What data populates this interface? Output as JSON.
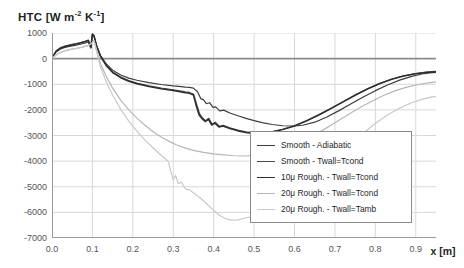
{
  "chart_data": {
    "type": "line",
    "title": "HTC [W m-2 K-1]",
    "title_parts": {
      "main": "HTC [W m",
      "sup1": "-2",
      "mid": " K",
      "sup2": "-1",
      "tail": "]"
    },
    "xlabel": "x [m]",
    "ylabel": "HTC [W m-2 K-1]",
    "xlim": [
      0.0,
      0.95
    ],
    "ylim": [
      -7000,
      1000
    ],
    "xticks": [
      "0.0",
      "0.1",
      "0.2",
      "0.3",
      "0.4",
      "0.5",
      "0.6",
      "0.7",
      "0.8",
      "0.9"
    ],
    "xtick_values": [
      0.0,
      0.1,
      0.2,
      0.3,
      0.4,
      0.5,
      0.6,
      0.7,
      0.8,
      0.9
    ],
    "yticks": [
      "1000",
      "0",
      "-1000",
      "-2000",
      "-3000",
      "-4000",
      "-5000",
      "-6000",
      "-7000"
    ],
    "ytick_values": [
      1000,
      0,
      -1000,
      -2000,
      -3000,
      -4000,
      -5000,
      -6000,
      -7000
    ],
    "grid": true,
    "legend_position": "lower right",
    "series": [
      {
        "name": "Smooth - Adiabatic",
        "color": "#3d3d3d",
        "width": 1.2,
        "points": [
          [
            0.0,
            30
          ],
          [
            0.01,
            260
          ],
          [
            0.02,
            370
          ],
          [
            0.03,
            430
          ],
          [
            0.04,
            470
          ],
          [
            0.05,
            500
          ],
          [
            0.06,
            530
          ],
          [
            0.07,
            560
          ],
          [
            0.08,
            600
          ],
          [
            0.09,
            650
          ],
          [
            0.096,
            420
          ],
          [
            0.1,
            930
          ],
          [
            0.104,
            880
          ],
          [
            0.11,
            500
          ],
          [
            0.12,
            120
          ],
          [
            0.135,
            -220
          ],
          [
            0.15,
            -450
          ],
          [
            0.17,
            -640
          ],
          [
            0.19,
            -760
          ],
          [
            0.21,
            -845
          ],
          [
            0.24,
            -940
          ],
          [
            0.27,
            -1010
          ],
          [
            0.3,
            -1065
          ],
          [
            0.32,
            -1095
          ],
          [
            0.33,
            -1110
          ],
          [
            0.34,
            -1120
          ],
          [
            0.35,
            -1150
          ],
          [
            0.36,
            -1290
          ],
          [
            0.368,
            -1560
          ],
          [
            0.375,
            -1610
          ],
          [
            0.382,
            -1760
          ],
          [
            0.39,
            -1720
          ],
          [
            0.398,
            -1900
          ],
          [
            0.405,
            -1880
          ],
          [
            0.415,
            -2040
          ],
          [
            0.425,
            -2010
          ],
          [
            0.44,
            -2120
          ],
          [
            0.46,
            -2230
          ],
          [
            0.48,
            -2330
          ],
          [
            0.5,
            -2420
          ],
          [
            0.52,
            -2500
          ],
          [
            0.545,
            -2570
          ],
          [
            0.57,
            -2620
          ],
          [
            0.6,
            -2630
          ],
          [
            0.62,
            -2600
          ],
          [
            0.65,
            -2480
          ],
          [
            0.68,
            -2280
          ],
          [
            0.71,
            -2030
          ],
          [
            0.74,
            -1760
          ],
          [
            0.77,
            -1500
          ],
          [
            0.8,
            -1250
          ],
          [
            0.83,
            -1030
          ],
          [
            0.86,
            -840
          ],
          [
            0.89,
            -690
          ],
          [
            0.915,
            -600
          ],
          [
            0.935,
            -560
          ],
          [
            0.95,
            -540
          ]
        ]
      },
      {
        "name": "Smooth - Twall=Tcond",
        "color": "#4a4a4a",
        "width": 1.2,
        "points": [
          [
            0.0,
            25
          ],
          [
            0.01,
            300
          ],
          [
            0.02,
            420
          ],
          [
            0.03,
            480
          ],
          [
            0.04,
            520
          ],
          [
            0.05,
            555
          ],
          [
            0.06,
            585
          ],
          [
            0.07,
            620
          ],
          [
            0.08,
            665
          ],
          [
            0.09,
            720
          ],
          [
            0.096,
            450
          ],
          [
            0.1,
            960
          ],
          [
            0.104,
            900
          ],
          [
            0.11,
            520
          ],
          [
            0.12,
            100
          ],
          [
            0.135,
            -270
          ],
          [
            0.15,
            -520
          ],
          [
            0.17,
            -720
          ],
          [
            0.19,
            -860
          ],
          [
            0.21,
            -955
          ],
          [
            0.24,
            -1060
          ],
          [
            0.27,
            -1145
          ],
          [
            0.3,
            -1215
          ],
          [
            0.32,
            -1265
          ],
          [
            0.33,
            -1295
          ],
          [
            0.34,
            -1320
          ],
          [
            0.35,
            -1380
          ],
          [
            0.358,
            -1790
          ],
          [
            0.365,
            -2150
          ],
          [
            0.372,
            -2300
          ],
          [
            0.38,
            -2420
          ],
          [
            0.388,
            -2330
          ],
          [
            0.396,
            -2560
          ],
          [
            0.404,
            -2480
          ],
          [
            0.414,
            -2640
          ],
          [
            0.424,
            -2600
          ],
          [
            0.44,
            -2700
          ],
          [
            0.46,
            -2790
          ],
          [
            0.48,
            -2860
          ],
          [
            0.5,
            -2900
          ],
          [
            0.52,
            -2900
          ],
          [
            0.545,
            -2850
          ],
          [
            0.57,
            -2760
          ],
          [
            0.6,
            -2620
          ],
          [
            0.63,
            -2420
          ],
          [
            0.66,
            -2190
          ],
          [
            0.69,
            -1940
          ],
          [
            0.72,
            -1680
          ],
          [
            0.75,
            -1420
          ],
          [
            0.78,
            -1180
          ],
          [
            0.81,
            -970
          ],
          [
            0.84,
            -800
          ],
          [
            0.87,
            -670
          ],
          [
            0.9,
            -580
          ],
          [
            0.925,
            -530
          ],
          [
            0.95,
            -500
          ]
        ]
      },
      {
        "name": "10u Rough. - Twall=Tcond",
        "color": "#2e2e2e",
        "width": 1.5,
        "points": [
          [
            0.0,
            20
          ],
          [
            0.01,
            280
          ],
          [
            0.02,
            400
          ],
          [
            0.03,
            460
          ],
          [
            0.04,
            505
          ],
          [
            0.05,
            540
          ],
          [
            0.06,
            575
          ],
          [
            0.07,
            610
          ],
          [
            0.08,
            655
          ],
          [
            0.09,
            710
          ],
          [
            0.096,
            430
          ],
          [
            0.1,
            950
          ],
          [
            0.104,
            890
          ],
          [
            0.11,
            510
          ],
          [
            0.12,
            90
          ],
          [
            0.135,
            -290
          ],
          [
            0.15,
            -545
          ],
          [
            0.17,
            -745
          ],
          [
            0.19,
            -885
          ],
          [
            0.21,
            -980
          ],
          [
            0.24,
            -1090
          ],
          [
            0.27,
            -1175
          ],
          [
            0.3,
            -1245
          ],
          [
            0.32,
            -1300
          ],
          [
            0.33,
            -1330
          ],
          [
            0.34,
            -1355
          ],
          [
            0.35,
            -1420
          ],
          [
            0.357,
            -1850
          ],
          [
            0.364,
            -2200
          ],
          [
            0.371,
            -2340
          ],
          [
            0.379,
            -2455
          ],
          [
            0.387,
            -2370
          ],
          [
            0.395,
            -2590
          ],
          [
            0.403,
            -2520
          ],
          [
            0.413,
            -2670
          ],
          [
            0.423,
            -2630
          ],
          [
            0.44,
            -2730
          ],
          [
            0.46,
            -2820
          ],
          [
            0.48,
            -2880
          ],
          [
            0.5,
            -2920
          ],
          [
            0.52,
            -2915
          ],
          [
            0.545,
            -2860
          ],
          [
            0.57,
            -2770
          ],
          [
            0.6,
            -2630
          ],
          [
            0.63,
            -2430
          ],
          [
            0.66,
            -2200
          ],
          [
            0.69,
            -1950
          ],
          [
            0.72,
            -1690
          ],
          [
            0.75,
            -1430
          ],
          [
            0.78,
            -1190
          ],
          [
            0.81,
            -980
          ],
          [
            0.84,
            -810
          ],
          [
            0.87,
            -680
          ],
          [
            0.9,
            -590
          ],
          [
            0.925,
            -540
          ],
          [
            0.95,
            -510
          ]
        ]
      },
      {
        "name": "20u Rough. - Twall=Tcond",
        "color": "#b6b6b6",
        "width": 1.2,
        "points": [
          [
            0.0,
            15
          ],
          [
            0.015,
            200
          ],
          [
            0.03,
            300
          ],
          [
            0.045,
            360
          ],
          [
            0.06,
            400
          ],
          [
            0.075,
            450
          ],
          [
            0.09,
            520
          ],
          [
            0.098,
            600
          ],
          [
            0.104,
            700
          ],
          [
            0.112,
            250
          ],
          [
            0.12,
            -200
          ],
          [
            0.135,
            -720
          ],
          [
            0.15,
            -1150
          ],
          [
            0.17,
            -1620
          ],
          [
            0.19,
            -2000
          ],
          [
            0.21,
            -2320
          ],
          [
            0.23,
            -2600
          ],
          [
            0.25,
            -2850
          ],
          [
            0.27,
            -3060
          ],
          [
            0.29,
            -3230
          ],
          [
            0.31,
            -3380
          ],
          [
            0.33,
            -3490
          ],
          [
            0.35,
            -3580
          ],
          [
            0.375,
            -3660
          ],
          [
            0.4,
            -3720
          ],
          [
            0.425,
            -3760
          ],
          [
            0.45,
            -3790
          ],
          [
            0.475,
            -3800
          ],
          [
            0.5,
            -3780
          ],
          [
            0.525,
            -3730
          ],
          [
            0.55,
            -3650
          ],
          [
            0.58,
            -3500
          ],
          [
            0.61,
            -3300
          ],
          [
            0.64,
            -3060
          ],
          [
            0.67,
            -2790
          ],
          [
            0.7,
            -2500
          ],
          [
            0.73,
            -2210
          ],
          [
            0.76,
            -1930
          ],
          [
            0.79,
            -1670
          ],
          [
            0.82,
            -1440
          ],
          [
            0.85,
            -1250
          ],
          [
            0.88,
            -1100
          ],
          [
            0.91,
            -1000
          ],
          [
            0.935,
            -940
          ],
          [
            0.95,
            -910
          ]
        ]
      },
      {
        "name": "20u Rough. - Twall=Tamb",
        "color": "#c9c9c9",
        "width": 1.2,
        "points": [
          [
            0.0,
            10
          ],
          [
            0.015,
            190
          ],
          [
            0.03,
            290
          ],
          [
            0.045,
            350
          ],
          [
            0.06,
            395
          ],
          [
            0.075,
            445
          ],
          [
            0.09,
            510
          ],
          [
            0.098,
            590
          ],
          [
            0.104,
            690
          ],
          [
            0.112,
            180
          ],
          [
            0.12,
            -330
          ],
          [
            0.135,
            -930
          ],
          [
            0.15,
            -1420
          ],
          [
            0.17,
            -1980
          ],
          [
            0.19,
            -2440
          ],
          [
            0.21,
            -2830
          ],
          [
            0.23,
            -3180
          ],
          [
            0.25,
            -3480
          ],
          [
            0.265,
            -3700
          ],
          [
            0.278,
            -3880
          ],
          [
            0.288,
            -4020
          ],
          [
            0.294,
            -4420
          ],
          [
            0.3,
            -4720
          ],
          [
            0.306,
            -4560
          ],
          [
            0.312,
            -4880
          ],
          [
            0.32,
            -4820
          ],
          [
            0.33,
            -5080
          ],
          [
            0.34,
            -5120
          ],
          [
            0.355,
            -5300
          ],
          [
            0.37,
            -5480
          ],
          [
            0.385,
            -5700
          ],
          [
            0.4,
            -5920
          ],
          [
            0.415,
            -6120
          ],
          [
            0.43,
            -6250
          ],
          [
            0.445,
            -6300
          ],
          [
            0.46,
            -6290
          ],
          [
            0.475,
            -6230
          ],
          [
            0.49,
            -6180
          ],
          [
            0.505,
            -6190
          ],
          [
            0.52,
            -6120
          ],
          [
            0.54,
            -5950
          ],
          [
            0.565,
            -5700
          ],
          [
            0.59,
            -5400
          ],
          [
            0.62,
            -5000
          ],
          [
            0.65,
            -4580
          ],
          [
            0.68,
            -4150
          ],
          [
            0.71,
            -3720
          ],
          [
            0.74,
            -3300
          ],
          [
            0.77,
            -2900
          ],
          [
            0.8,
            -2530
          ],
          [
            0.83,
            -2200
          ],
          [
            0.86,
            -1930
          ],
          [
            0.89,
            -1720
          ],
          [
            0.915,
            -1590
          ],
          [
            0.935,
            -1510
          ],
          [
            0.95,
            -1470
          ]
        ]
      }
    ]
  },
  "legend": {
    "items": [
      {
        "label": "Smooth - Adiabatic",
        "color": "#3d3d3d",
        "width": 1.2
      },
      {
        "label": "Smooth - Twall=Tcond",
        "color": "#4a4a4a",
        "width": 1.2
      },
      {
        "label": "10μ Rough. - Twall=Tcond",
        "color": "#2e2e2e",
        "width": 1.7
      },
      {
        "label": "20μ Rough. - Twall=Tcond",
        "color": "#b6b6b6",
        "width": 1.2
      },
      {
        "label": "20μ Rough. - Twall=Tamb",
        "color": "#c9c9c9",
        "width": 1.2
      }
    ]
  },
  "colors": {
    "grid": "#d8d8d8",
    "axis": "#9a9a9a",
    "zero_line": "#8d8d8d",
    "text": "#3a3a3a",
    "background": "#ffffff"
  }
}
